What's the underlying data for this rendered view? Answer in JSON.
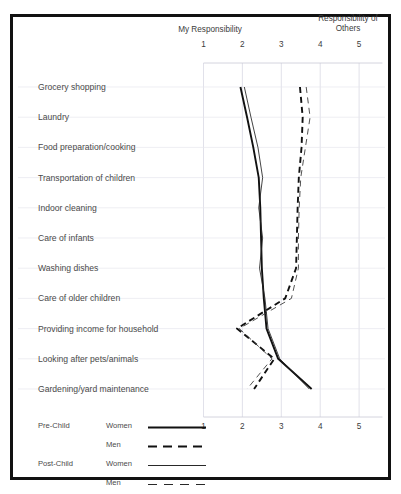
{
  "chart_data": {
    "type": "line",
    "orientation": "horizontal",
    "title": "",
    "xlabel": "",
    "ylabel": "",
    "axis_titles": {
      "left": "My Responsibility",
      "right": "Responsibility of Others"
    },
    "xlim": [
      0.6,
      5.6
    ],
    "xticks": [
      1,
      2,
      3,
      4,
      5
    ],
    "xtick_labels": [
      "1",
      "2",
      "3",
      "4",
      "5"
    ],
    "xaxis_position": "both",
    "grid": true,
    "grid_color": "#d9d9e4",
    "legend_position": "bottom-left",
    "categories": [
      "Grocery shopping",
      "Laundry",
      "Food preparation/cooking",
      "Transportation of children",
      "Indoor cleaning",
      "Care of infants",
      "Washing dishes",
      "Care of older children",
      "Providing income for household",
      "Looking after pets/animals",
      "Gardening/yard maintenance"
    ],
    "series": [
      {
        "name": "Pre-Child Women",
        "group": "Pre-Child",
        "sex": "Women",
        "style": "solid",
        "weight": "thick",
        "color": "#111111",
        "values": [
          1.95,
          2.12,
          2.28,
          2.42,
          2.46,
          2.48,
          2.5,
          2.55,
          2.62,
          2.92,
          3.78
        ]
      },
      {
        "name": "Pre-Child Men",
        "group": "Pre-Child",
        "sex": "Men",
        "style": "dashed",
        "weight": "thick",
        "color": "#111111",
        "values": [
          3.48,
          3.55,
          3.52,
          3.45,
          3.42,
          3.4,
          3.38,
          3.1,
          1.86,
          2.82,
          2.3
        ]
      },
      {
        "name": "Post-Child Women",
        "group": "Post-Child",
        "sex": "Women",
        "style": "solid",
        "weight": "thin",
        "color": "#222222",
        "values": [
          2.05,
          2.22,
          2.4,
          2.52,
          2.42,
          2.52,
          2.44,
          2.58,
          2.66,
          2.96,
          3.72
        ]
      },
      {
        "name": "Post-Child Men",
        "group": "Post-Child",
        "sex": "Men",
        "style": "dashed",
        "weight": "thin",
        "color": "#333333",
        "values": [
          3.64,
          3.74,
          3.62,
          3.5,
          3.46,
          3.44,
          3.44,
          3.26,
          1.92,
          2.76,
          2.12
        ]
      }
    ]
  },
  "legend": {
    "groups": [
      {
        "group_label": "Pre-Child",
        "entries": [
          {
            "label": "Women",
            "style": "solid-thick"
          },
          {
            "label": "Men",
            "style": "dashed-thick"
          }
        ]
      },
      {
        "group_label": "Post-Child",
        "entries": [
          {
            "label": "Women",
            "style": "solid-thin"
          },
          {
            "label": "Men",
            "style": "dashed-thin"
          }
        ]
      }
    ]
  }
}
